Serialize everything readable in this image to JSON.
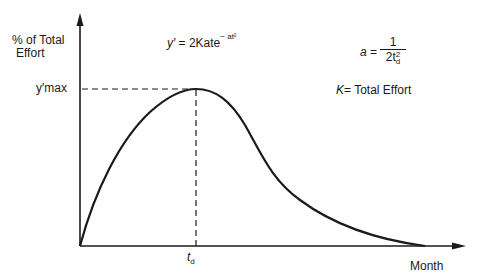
{
  "diagram": {
    "y_axis_label_line1": "% of Total",
    "y_axis_label_line2": "Effort",
    "x_axis_label": "Month",
    "y_tick_label": "y′max",
    "x_tick_label_t": "t",
    "x_tick_label_sub": "d",
    "equation": {
      "lhs": "y′",
      "eq": " = 2Kate",
      "exponent": "− at²"
    },
    "param_a": {
      "lhs": "a",
      "eq": "=",
      "numerator": "1",
      "denominator": "2t",
      "denominator_sup": "2",
      "denominator_sub": "d"
    },
    "param_k": {
      "lhs": "K",
      "rhs": "= Total Effort"
    },
    "colors": {
      "line": "#1a1a1a",
      "background": "#ffffff"
    }
  }
}
